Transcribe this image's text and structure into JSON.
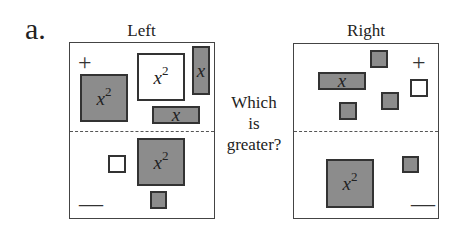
{
  "figure": {
    "label": "a.",
    "question_lines": [
      "Which",
      "is",
      "greater?"
    ],
    "colors": {
      "negative_tile": "#8c8c8c",
      "positive_tile": "#ffffff",
      "border": "#333333"
    },
    "panels": {
      "left": {
        "title": "Left",
        "plus_sign": "+",
        "minus_sign": "—",
        "tiles": [
          {
            "type": "x2",
            "sign": "negative",
            "region": "top",
            "text": "x",
            "exp": "2"
          },
          {
            "type": "x2",
            "sign": "positive",
            "region": "top",
            "text": "x",
            "exp": "2"
          },
          {
            "type": "x",
            "sign": "negative",
            "region": "top",
            "orientation": "vertical",
            "text": "x"
          },
          {
            "type": "x",
            "sign": "negative",
            "region": "top",
            "orientation": "horizontal",
            "text": "x"
          },
          {
            "type": "unit",
            "sign": "positive",
            "region": "bottom"
          },
          {
            "type": "x2",
            "sign": "negative",
            "region": "bottom",
            "text": "x",
            "exp": "2"
          },
          {
            "type": "unit",
            "sign": "negative",
            "region": "bottom"
          }
        ]
      },
      "right": {
        "title": "Right",
        "plus_sign": "+",
        "minus_sign": "—",
        "tiles": [
          {
            "type": "unit",
            "sign": "negative",
            "region": "top"
          },
          {
            "type": "x",
            "sign": "negative",
            "region": "top",
            "orientation": "horizontal",
            "text": "x"
          },
          {
            "type": "unit",
            "sign": "positive",
            "region": "top"
          },
          {
            "type": "unit",
            "sign": "negative",
            "region": "top"
          },
          {
            "type": "unit",
            "sign": "negative",
            "region": "top"
          },
          {
            "type": "x2",
            "sign": "negative",
            "region": "bottom",
            "text": "x",
            "exp": "2"
          },
          {
            "type": "unit",
            "sign": "negative",
            "region": "bottom"
          }
        ]
      }
    }
  }
}
